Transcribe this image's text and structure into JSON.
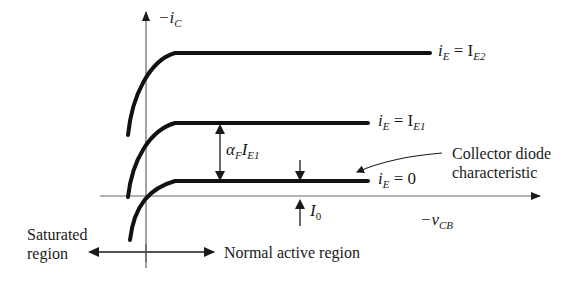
{
  "diagram": {
    "y_axis": {
      "label_prefix": "−i",
      "label_sub": "C"
    },
    "x_axis": {
      "label_prefix": "−v",
      "label_sub": "CB"
    },
    "curves": [
      {
        "id": "ie2",
        "label_lhs": "i",
        "lhs_sub": "E",
        "eq": " = I",
        "rhs_sub": "E2"
      },
      {
        "id": "ie1",
        "label_lhs": "i",
        "lhs_sub": "E",
        "eq": " = I",
        "rhs_sub": "E1"
      },
      {
        "id": "ie0",
        "label_lhs": "i",
        "lhs_sub": "E",
        "eq": " = 0",
        "rhs_sub": ""
      }
    ],
    "annotations": {
      "alpha": {
        "sym": "α",
        "sym_sub": "F",
        "main": "I",
        "main_sub": "E1"
      },
      "i0": {
        "main": "I",
        "sub": "0"
      },
      "collector_diode": {
        "line1": "Collector diode",
        "line2": "characteristic"
      },
      "saturated": {
        "line1": "Saturated",
        "line2": "region"
      },
      "normal_active": "Normal active region"
    },
    "colors": {
      "ink": "#1a1a1a",
      "axis": "#555555",
      "background": "#ffffff"
    }
  }
}
